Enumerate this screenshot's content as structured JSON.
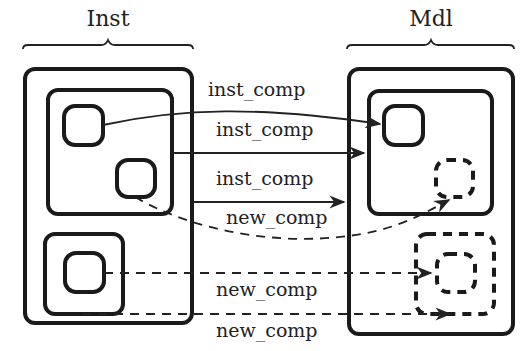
{
  "groups": {
    "left": {
      "title": "Inst"
    },
    "right": {
      "title": "Mdl"
    }
  },
  "edges": [
    {
      "id": "e1",
      "label": "inst_comp",
      "style": "solid",
      "from": "inst-box-a",
      "to": "mdl-box-d"
    },
    {
      "id": "e2",
      "label": "inst_comp",
      "style": "solid",
      "from": "inst-inner-top",
      "to": "mdl-inner-top"
    },
    {
      "id": "e3",
      "label": "inst_comp",
      "style": "solid",
      "from": "inst-outer",
      "to": "mdl-outer"
    },
    {
      "id": "e4",
      "label": "new_comp",
      "style": "dashed",
      "from": "inst-box-b",
      "to": "mdl-box-e"
    },
    {
      "id": "e5",
      "label": "new_comp",
      "style": "dashed",
      "from": "inst-box-c",
      "to": "mdl-box-g"
    },
    {
      "id": "e6",
      "label": "new_comp",
      "style": "dashed",
      "from": "inst-inner-bottom",
      "to": "mdl-box-f"
    }
  ],
  "legend_hint": {
    "solid_box": "existing component",
    "dashed_box": "new component"
  },
  "colors": {
    "stroke": "#1a1a1a",
    "background": "#ffffff"
  }
}
